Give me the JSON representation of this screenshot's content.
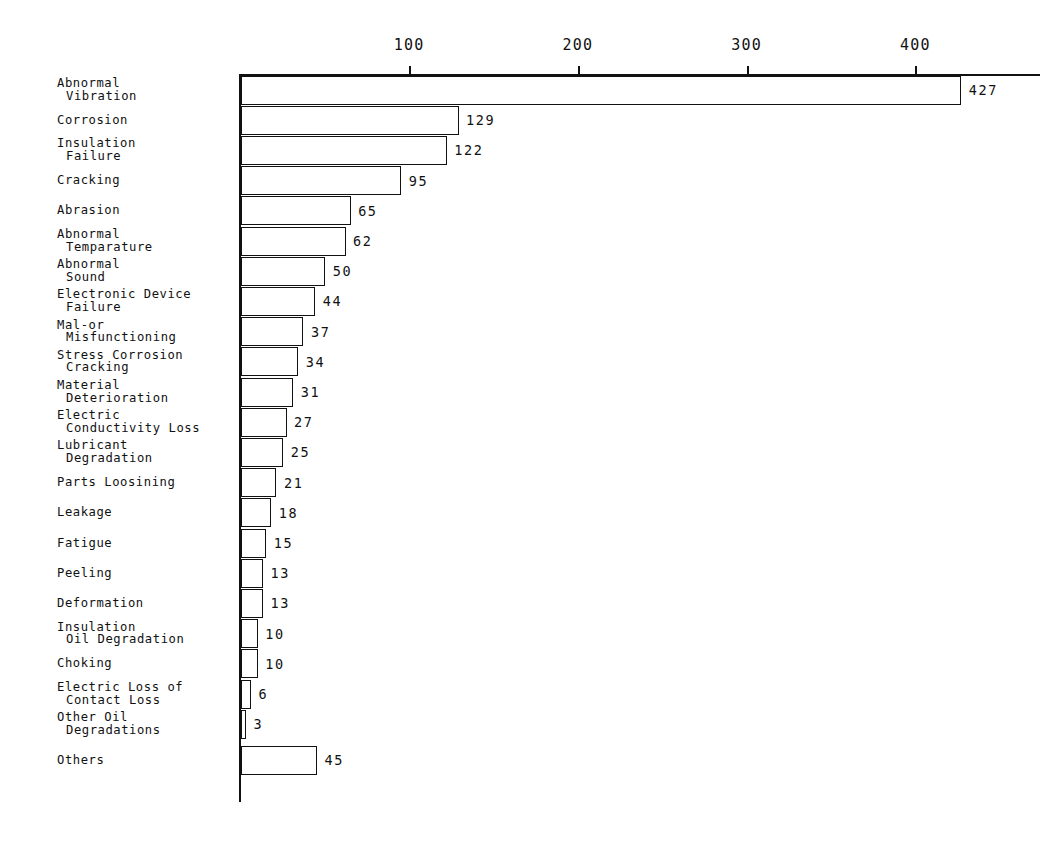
{
  "chart_data": {
    "type": "bar",
    "orientation": "horizontal",
    "title": "",
    "subtitle": "",
    "xlabel": "",
    "ylabel": "",
    "xlim": [
      0,
      450
    ],
    "grid": false,
    "legend": null,
    "axis_position": "top",
    "x_ticks": [
      100,
      200,
      300,
      400
    ],
    "x_tick_labels": [
      "100",
      "200",
      "300",
      "400"
    ],
    "categories": [
      "Abnormal Vibration",
      "Corrosion",
      "Insulation Failure",
      "Cracking",
      "Abrasion",
      "Abnormal Temparature",
      "Abnormal Sound",
      "Electronic Device Failure",
      "Mal-or Misfunctioning",
      "Stress Corrosion Cracking",
      "Material Deterioration",
      "Electric Conductivity Loss",
      "Lubricant Degradation",
      "Parts Loosining",
      "Leakage",
      "Fatigue",
      "Peeling",
      "Deformation",
      "Insulation Oil Degradation",
      "Choking",
      "Electric Loss of Contact Loss",
      "Other Oil Degradations",
      "Others"
    ],
    "values": [
      427,
      129,
      122,
      95,
      65,
      62,
      50,
      44,
      37,
      34,
      31,
      27,
      25,
      21,
      18,
      15,
      13,
      13,
      10,
      10,
      6,
      3,
      45
    ],
    "value_labels": [
      "427",
      "129",
      "122",
      "95",
      "65",
      "62",
      "50",
      "44",
      "37",
      "34",
      "31",
      "27",
      "25",
      "21",
      "18",
      "15",
      "13",
      "13",
      "10",
      "10",
      "6",
      "3",
      "45"
    ]
  },
  "categories_wrapped": [
    {
      "l1": "Abnormal",
      "l2": "Vibration"
    },
    {
      "l1": "Corrosion",
      "l2": ""
    },
    {
      "l1": "Insulation",
      "l2": "Failure"
    },
    {
      "l1": "Cracking",
      "l2": ""
    },
    {
      "l1": "Abrasion",
      "l2": ""
    },
    {
      "l1": "Abnormal",
      "l2": "Temparature"
    },
    {
      "l1": "Abnormal",
      "l2": "Sound"
    },
    {
      "l1": "Electronic Device",
      "l2": "Failure"
    },
    {
      "l1": "Mal-or",
      "l2": "Misfunctioning"
    },
    {
      "l1": "Stress Corrosion",
      "l2": "Cracking"
    },
    {
      "l1": "Material",
      "l2": "Deterioration"
    },
    {
      "l1": "Electric",
      "l2": "Conductivity Loss"
    },
    {
      "l1": "Lubricant",
      "l2": "Degradation"
    },
    {
      "l1": "Parts Loosining",
      "l2": ""
    },
    {
      "l1": "Leakage",
      "l2": ""
    },
    {
      "l1": "Fatigue",
      "l2": ""
    },
    {
      "l1": "Peeling",
      "l2": ""
    },
    {
      "l1": "Deformation",
      "l2": ""
    },
    {
      "l1": "Insulation",
      "l2": "Oil Degradation"
    },
    {
      "l1": "Choking",
      "l2": ""
    },
    {
      "l1": "Electric Loss of",
      "l2": "Contact Loss"
    },
    {
      "l1": "Other Oil",
      "l2": "Degradations"
    },
    {
      "l1": "Others",
      "l2": ""
    }
  ],
  "colors": {
    "ink": "#111111",
    "background": "#ffffff",
    "bar_fill": "#ffffff"
  }
}
